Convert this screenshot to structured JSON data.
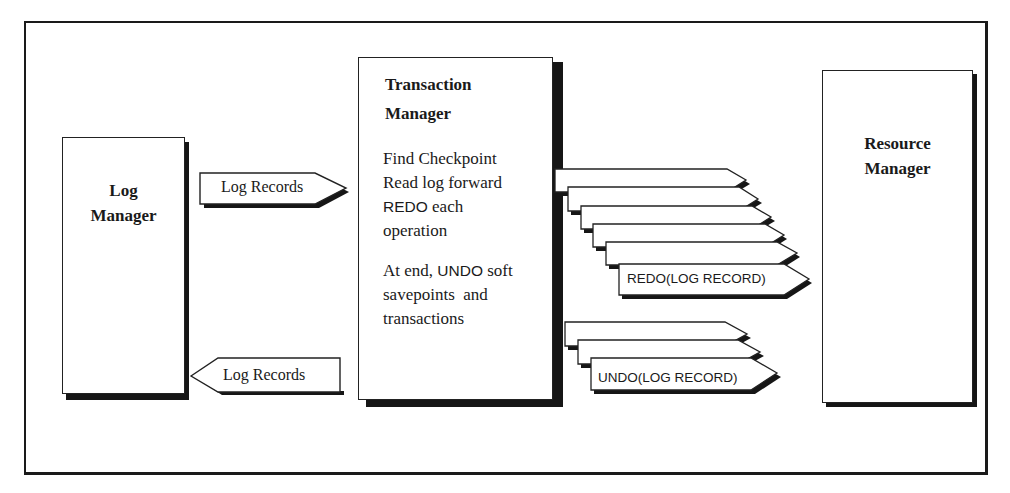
{
  "diagram": {
    "log_manager": {
      "title_line1": "Log",
      "title_line2": "Manager"
    },
    "transaction_manager": {
      "title_line1": "Transaction",
      "title_line2": "Manager",
      "steps": {
        "line1": "Find Checkpoint",
        "line2": "Read log forward",
        "line3_prefix": "REDO",
        "line3_suffix": " each",
        "line4": "operation",
        "line5_prefix": "At end, ",
        "line5_mid": "UNDO",
        "line5_suffix": " soft",
        "line6": "savepoints  and",
        "line7": "transactions"
      }
    },
    "resource_manager": {
      "title_line1": "Resource",
      "title_line2": "Manager"
    },
    "arrows": {
      "log_to_tm": "Log Records",
      "tm_to_log": "Log Records"
    },
    "redo_records": {
      "count": 6,
      "front_label": "REDO(LOG RECORD)",
      "partial_label": "REDO (LOG RECORD)"
    },
    "undo_records": {
      "count": 3,
      "front_label": "UNDO(LOG RECORD)",
      "partial_label": "UNDO (LOG RECORD)"
    },
    "colors": {
      "ink": "#1a1a1a",
      "paper": "#ffffff",
      "shadow": "#161616"
    }
  }
}
